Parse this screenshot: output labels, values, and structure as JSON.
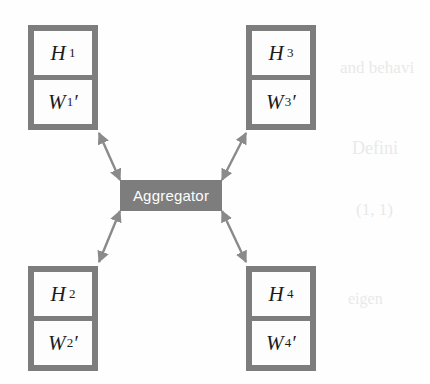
{
  "figure": {
    "type": "node-aggregator-diagram",
    "background_color": "#fefefe",
    "box_fill_color": "#7d7d7d",
    "cell_fill_color": "#fdfdfd",
    "arrow_color": "#8a8a8a",
    "text_color": "#1b1b1b",
    "aggregator_text_color": "#fdfdfd"
  },
  "aggregator": {
    "label": "Aggregator"
  },
  "nodes": [
    {
      "id": "node-1",
      "position": "top-left",
      "head": "H",
      "head_sub": "1",
      "weight": "W",
      "weight_prime": "′",
      "weight_sub": "1"
    },
    {
      "id": "node-2",
      "position": "bottom-left",
      "head": "H",
      "head_sub": "2",
      "weight": "W",
      "weight_prime": "′",
      "weight_sub": "2"
    },
    {
      "id": "node-3",
      "position": "top-right",
      "head": "H",
      "head_sub": "3",
      "weight": "W",
      "weight_prime": "′",
      "weight_sub": "3"
    },
    {
      "id": "node-4",
      "position": "bottom-right",
      "head": "H",
      "head_sub": "4",
      "weight": "W",
      "weight_prime": "′",
      "weight_sub": "4"
    }
  ],
  "connections": [
    {
      "id": "edge-1",
      "from": "aggregator",
      "to": "node-1",
      "style": "double-headed-arrow"
    },
    {
      "id": "edge-2",
      "from": "aggregator",
      "to": "node-2",
      "style": "double-headed-arrow"
    },
    {
      "id": "edge-3",
      "from": "aggregator",
      "to": "node-3",
      "style": "double-headed-arrow"
    },
    {
      "id": "edge-4",
      "from": "aggregator",
      "to": "node-4",
      "style": "double-headed-arrow"
    }
  ],
  "scan_artifacts": [
    {
      "text": "and behavi",
      "x": 340,
      "y": 68,
      "size": 17
    },
    {
      "text": "Defini",
      "x": 352,
      "y": 148,
      "size": 18
    },
    {
      "text": "(1, 1)",
      "x": 356,
      "y": 210,
      "size": 17
    },
    {
      "text": "eigen",
      "x": 348,
      "y": 300,
      "size": 16
    }
  ]
}
